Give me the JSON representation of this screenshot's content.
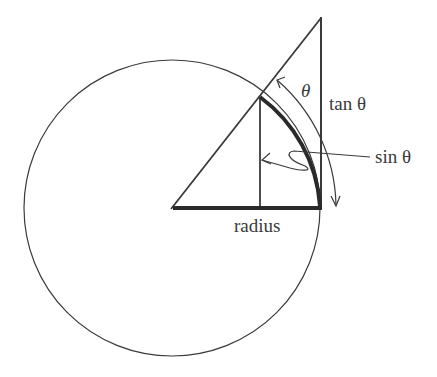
{
  "diagram": {
    "labels": {
      "theta": "θ",
      "tan": "tan θ",
      "sin": "sin θ",
      "radius": "radius"
    },
    "colors": {
      "stroke": "#3a3a3a",
      "background": "#ffffff"
    },
    "geometry": {
      "center": [
        172,
        208
      ],
      "radius_px": 148
    }
  }
}
